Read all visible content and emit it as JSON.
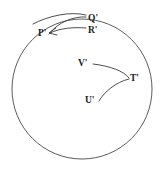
{
  "figure": {
    "type": "geometry-diagram",
    "background_color": "#ffffff",
    "stroke_color": "#3a3a3a",
    "boundary": {
      "shape": "circle",
      "center_x": 82,
      "center_y": 89,
      "radius": 70
    },
    "labels": {
      "p_prime": "P'",
      "q_prime": "Q'",
      "r_prime": "R'",
      "t_prime": "T'",
      "u_prime": "U'",
      "v_prime": "V'"
    },
    "label_positions": {
      "p_prime": {
        "x": 38,
        "y": 29
      },
      "q_prime": {
        "x": 88,
        "y": 14
      },
      "r_prime": {
        "x": 88,
        "y": 26
      },
      "v_prime": {
        "x": 78,
        "y": 59
      },
      "t_prime": {
        "x": 130,
        "y": 74
      },
      "u_prime": {
        "x": 85,
        "y": 96
      }
    },
    "curves": [
      {
        "name": "arc-p-to-q",
        "from": "P'",
        "to": "Q'",
        "path": "M 49 34 C 58 22, 74 16, 86 17"
      },
      {
        "name": "arc-p-to-r",
        "from": "P'",
        "to": "R'",
        "path": "M 50 33 C 60 28, 74 27, 86 28"
      },
      {
        "name": "arc-outer-upper",
        "from": "P'",
        "to": "Q'",
        "path": "M 33 24 C 48 16, 70 11, 86 15"
      },
      {
        "name": "curve-v-to-t",
        "from": "V'",
        "to": "T'",
        "path": "M 93 64 C 110 66, 124 71, 129 78"
      },
      {
        "name": "curve-u-to-t",
        "from": "U'",
        "to": "T'",
        "path": "M 99 101 C 104 92, 116 82, 129 79"
      }
    ],
    "arrowheads": [
      {
        "name": "arrowhead-at-p",
        "at": "P'",
        "path": "M 56 28 L 49 33 L 57 35"
      }
    ]
  }
}
